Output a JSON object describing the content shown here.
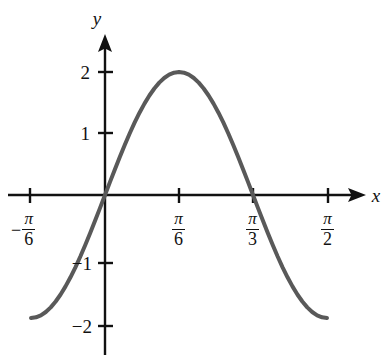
{
  "chart_data": {
    "type": "line",
    "title": "",
    "xlabel": "x",
    "ylabel": "y",
    "function": "y = 2 sin(3x)",
    "amplitude": 2,
    "period_label": "2π/3",
    "grid": false,
    "legend": false,
    "xlim": [
      -0.6283185307,
      1.6755160819
    ],
    "ylim": [
      -2.45,
      2.45
    ],
    "x_tick_labels": [
      {
        "id": "neg-pi-over-6",
        "sign": "−",
        "numerator": "π",
        "denominator": "6",
        "value": -0.5235987756
      },
      {
        "id": "pi-over-6",
        "sign": "",
        "numerator": "π",
        "denominator": "6",
        "value": 0.5235987756
      },
      {
        "id": "pi-over-3",
        "sign": "",
        "numerator": "π",
        "denominator": "3",
        "value": 1.0471975512
      },
      {
        "id": "pi-over-2",
        "sign": "",
        "numerator": "π",
        "denominator": "2",
        "value": 1.5707963268
      }
    ],
    "y_tick_labels": [
      {
        "id": "y-2",
        "text": "2",
        "value": 2
      },
      {
        "id": "y-1",
        "text": "1",
        "value": 1
      },
      {
        "id": "y-neg-1",
        "text": "−1",
        "value": -1
      },
      {
        "id": "y-neg-2",
        "text": "−2",
        "value": -2
      }
    ],
    "key_points": [
      {
        "label": "left-endpoint",
        "x": -0.5235987756,
        "y": -2.0
      },
      {
        "label": "zero-origin",
        "x": 0,
        "y": 0
      },
      {
        "label": "maximum",
        "x": 0.5235987756,
        "y": 2.0
      },
      {
        "label": "zero-crossing",
        "x": 1.0471975512,
        "y": 0
      },
      {
        "label": "right-endpoint",
        "x": 1.5707963268,
        "y": -2.0
      }
    ],
    "series": [
      {
        "name": "y = 2 sin(3x)",
        "color": "#595959",
        "line_width": 4,
        "x": [
          -0.5236,
          -0.4887,
          -0.4538,
          -0.4189,
          -0.384,
          -0.3491,
          -0.3142,
          -0.2793,
          -0.2443,
          -0.2094,
          -0.1745,
          -0.1396,
          -0.1047,
          -0.0698,
          -0.0349,
          0.0,
          0.0349,
          0.0698,
          0.1047,
          0.1396,
          0.1745,
          0.2094,
          0.2443,
          0.2793,
          0.3142,
          0.3491,
          0.384,
          0.4189,
          0.4538,
          0.4887,
          0.5236,
          0.5585,
          0.5934,
          0.6283,
          0.6632,
          0.6981,
          0.733,
          0.7679,
          0.8029,
          0.8378,
          0.8727,
          0.9076,
          0.9425,
          0.9774,
          1.0123,
          1.0472,
          1.0821,
          1.117,
          1.1519,
          1.1868,
          1.2217,
          1.2566,
          1.2915,
          1.3265,
          1.3614,
          1.3963,
          1.4312,
          1.4661,
          1.501,
          1.5359,
          1.5708
        ],
        "y": [
          -2.0,
          -1.989,
          -1.9563,
          -1.9021,
          -1.8271,
          -1.7321,
          -1.618,
          -1.4863,
          -1.3383,
          -1.1756,
          -1.0,
          -0.8135,
          -0.618,
          -0.4158,
          -0.2091,
          0.0,
          0.2091,
          0.4158,
          0.618,
          0.8135,
          1.0,
          1.1756,
          1.3383,
          1.4863,
          1.618,
          1.7321,
          1.8271,
          1.9021,
          1.9563,
          1.989,
          2.0,
          1.989,
          1.9563,
          1.9021,
          1.8271,
          1.7321,
          1.618,
          1.4863,
          1.3383,
          1.1756,
          1.0,
          0.8135,
          0.618,
          0.4158,
          0.2091,
          0.0,
          -0.2091,
          -0.4158,
          -0.618,
          -0.8135,
          -1.0,
          -1.1756,
          -1.3383,
          -1.4863,
          -1.618,
          -1.7321,
          -1.8271,
          -1.9021,
          -1.9563,
          -1.989,
          -2.0
        ]
      }
    ],
    "axes": {
      "color": "#111111",
      "x_axis_arrow": true,
      "y_axis_arrow": true,
      "tick_mark_length": 14
    }
  }
}
